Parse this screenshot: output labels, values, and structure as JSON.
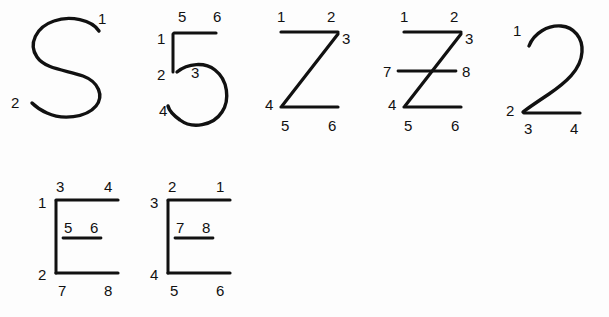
{
  "sheet": {
    "background_color": "#fdfdfd",
    "ink_color": "#111111",
    "width": 609,
    "height": 317,
    "rows": 2
  },
  "figures": [
    {
      "id": "figure-s-cursive",
      "name": "cursive-S",
      "row": 1,
      "column": 1,
      "endpoint_count": 2,
      "labels": [
        "1",
        "2"
      ],
      "label_positions": [
        {
          "text": "1",
          "x": 98,
          "y": 24
        },
        {
          "text": "2",
          "x": 11,
          "y": 108
        }
      ]
    },
    {
      "id": "figure-5-cursive",
      "name": "cursive-5",
      "row": 1,
      "column": 2,
      "endpoint_count": 6,
      "labels": [
        "1",
        "2",
        "3",
        "4",
        "5",
        "6"
      ],
      "label_positions": [
        {
          "text": "5",
          "x": 178,
          "y": 22
        },
        {
          "text": "6",
          "x": 213,
          "y": 22
        },
        {
          "text": "1",
          "x": 157,
          "y": 44
        },
        {
          "text": "2",
          "x": 157,
          "y": 80
        },
        {
          "text": "3",
          "x": 191,
          "y": 78
        },
        {
          "text": "4",
          "x": 159,
          "y": 116
        }
      ]
    },
    {
      "id": "figure-z-plain",
      "name": "block-Z",
      "row": 1,
      "column": 3,
      "endpoint_count": 6,
      "labels": [
        "1",
        "2",
        "3",
        "4",
        "5",
        "6"
      ],
      "label_positions": [
        {
          "text": "1",
          "x": 277,
          "y": 22
        },
        {
          "text": "2",
          "x": 327,
          "y": 22
        },
        {
          "text": "3",
          "x": 342,
          "y": 44
        },
        {
          "text": "4",
          "x": 265,
          "y": 110
        },
        {
          "text": "5",
          "x": 281,
          "y": 131
        },
        {
          "text": "6",
          "x": 328,
          "y": 131
        }
      ]
    },
    {
      "id": "figure-z-crossbar",
      "name": "block-Z-with-crossbar",
      "row": 1,
      "column": 4,
      "endpoint_count": 8,
      "labels": [
        "1",
        "2",
        "3",
        "4",
        "5",
        "6",
        "7",
        "8"
      ],
      "label_positions": [
        {
          "text": "1",
          "x": 400,
          "y": 22
        },
        {
          "text": "2",
          "x": 450,
          "y": 22
        },
        {
          "text": "3",
          "x": 465,
          "y": 44
        },
        {
          "text": "7",
          "x": 383,
          "y": 77
        },
        {
          "text": "8",
          "x": 462,
          "y": 77
        },
        {
          "text": "4",
          "x": 388,
          "y": 110
        },
        {
          "text": "5",
          "x": 404,
          "y": 131
        },
        {
          "text": "6",
          "x": 451,
          "y": 131
        }
      ]
    },
    {
      "id": "figure-2-cursive",
      "name": "cursive-2",
      "row": 1,
      "column": 5,
      "endpoint_count": 4,
      "labels": [
        "1",
        "2",
        "3",
        "4"
      ],
      "label_positions": [
        {
          "text": "1",
          "x": 513,
          "y": 36
        },
        {
          "text": "2",
          "x": 506,
          "y": 108
        },
        {
          "text": "3",
          "x": 524,
          "y": 130
        },
        {
          "text": "4",
          "x": 570,
          "y": 130
        }
      ]
    },
    {
      "id": "figure-e-left",
      "name": "block-E-left-variant",
      "row": 2,
      "column": 1,
      "endpoint_count": 8,
      "labels": [
        "1",
        "2",
        "3",
        "4",
        "5",
        "6",
        "7",
        "8"
      ],
      "label_positions": [
        {
          "text": "3",
          "x": 56,
          "y": 190
        },
        {
          "text": "4",
          "x": 104,
          "y": 190
        },
        {
          "text": "1",
          "x": 38,
          "y": 208
        },
        {
          "text": "5",
          "x": 64,
          "y": 233
        },
        {
          "text": "6",
          "x": 90,
          "y": 233
        },
        {
          "text": "2",
          "x": 38,
          "y": 280
        },
        {
          "text": "7",
          "x": 58,
          "y": 296
        },
        {
          "text": "8",
          "x": 104,
          "y": 296
        }
      ]
    },
    {
      "id": "figure-e-right",
      "name": "block-E-right-variant",
      "row": 2,
      "column": 2,
      "endpoint_count": 8,
      "labels": [
        "1",
        "2",
        "3",
        "4",
        "5",
        "6",
        "7",
        "8"
      ],
      "label_positions": [
        {
          "text": "2",
          "x": 168,
          "y": 190
        },
        {
          "text": "1",
          "x": 216,
          "y": 190
        },
        {
          "text": "3",
          "x": 150,
          "y": 208
        },
        {
          "text": "7",
          "x": 176,
          "y": 233
        },
        {
          "text": "8",
          "x": 202,
          "y": 233
        },
        {
          "text": "4",
          "x": 150,
          "y": 280
        },
        {
          "text": "5",
          "x": 170,
          "y": 296
        },
        {
          "text": "6",
          "x": 216,
          "y": 296
        }
      ]
    }
  ]
}
